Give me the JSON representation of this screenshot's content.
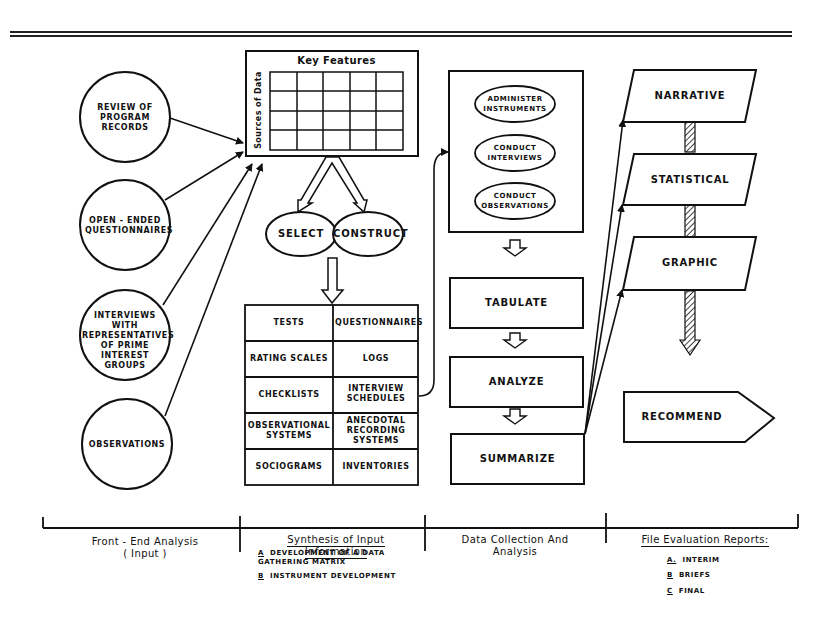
{
  "sources": [
    {
      "label": "REVIEW OF PROGRAM RECORDS"
    },
    {
      "label": "OPEN - ENDED QUESTIONNAIRES"
    },
    {
      "label": "INTERVIEWS WITH REPRESENTATIVES OF PRIME INTEREST GROUPS"
    },
    {
      "label": "OBSERVATIONS"
    }
  ],
  "matrix": {
    "title": "Key Features",
    "side_label": "Sources of Data",
    "rows": 4,
    "cols": 5
  },
  "choice": {
    "select": "SELECT",
    "construct": "CONSTRUCT"
  },
  "instruments": [
    [
      "TESTS",
      "QUESTIONNAIRES"
    ],
    [
      "RATING SCALES",
      "LOGS"
    ],
    [
      "CHECKLISTS",
      "INTERVIEW SCHEDULES"
    ],
    [
      "OBSERVATIONAL SYSTEMS",
      "ANECDOTAL RECORDING SYSTEMS"
    ],
    [
      "SOCIOGRAMS",
      "INVENTORIES"
    ]
  ],
  "collection": {
    "activities": [
      "ADMINISTER INSTRUMENTS",
      "CONDUCT INTERVIEWS",
      "CONDUCT OBSERVATIONS"
    ],
    "steps": [
      "TABULATE",
      "ANALYZE",
      "SUMMARIZE"
    ]
  },
  "reports": {
    "types": [
      "NARRATIVE",
      "STATISTICAL",
      "GRAPHIC"
    ],
    "recommend": "RECOMMEND"
  },
  "phases": [
    {
      "title": "Front - End Analysis",
      "subtitle": "( Input )",
      "items": []
    },
    {
      "title": "Synthesis of Input Information",
      "items": [
        {
          "key": "A",
          "text": "DEVELOPMENT OF A DATA GATHERING MATRIX"
        },
        {
          "key": "B",
          "text": "INSTRUMENT DEVELOPMENT"
        }
      ]
    },
    {
      "title": "Data Collection And",
      "subtitle": "Analysis",
      "items": []
    },
    {
      "title": "File Evaluation Reports:",
      "items": [
        {
          "key": "A.",
          "text": "INTERIM"
        },
        {
          "key": "B",
          "text": "BRIEFS"
        },
        {
          "key": "C",
          "text": "FINAL"
        }
      ]
    }
  ]
}
